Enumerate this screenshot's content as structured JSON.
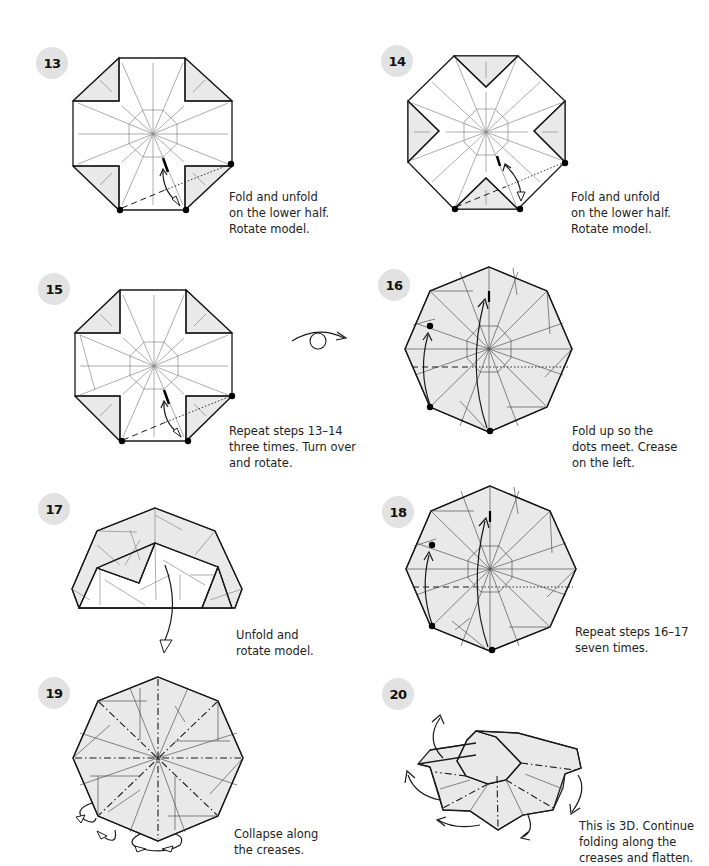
{
  "steps": [
    {
      "number": "13",
      "caption": "Fold and unfold\non the lower half.\nRotate model."
    },
    {
      "number": "14",
      "caption": "Fold and unfold\non the lower half.\nRotate model."
    },
    {
      "number": "15",
      "caption": "Repeat steps 13–14\nthree times. Turn over\nand rotate."
    },
    {
      "number": "16",
      "caption": "Fold up so the\ndots meet. Crease\non the left."
    },
    {
      "number": "17",
      "caption": "Unfold and\nrotate model."
    },
    {
      "number": "18",
      "caption": "Repeat steps 16–17\nseven times."
    },
    {
      "number": "19",
      "caption": "Collapse along\nthe creases."
    },
    {
      "number": "20",
      "caption": "This is 3D. Continue\nfolding along the\ncreases and flatten."
    }
  ],
  "symbols": {
    "turn_over": "turn-over-symbol"
  },
  "colors": {
    "badge_bg": "#e2e2e2",
    "paper_shaded": "#e9e9e9",
    "line": "#1a1a1a"
  }
}
